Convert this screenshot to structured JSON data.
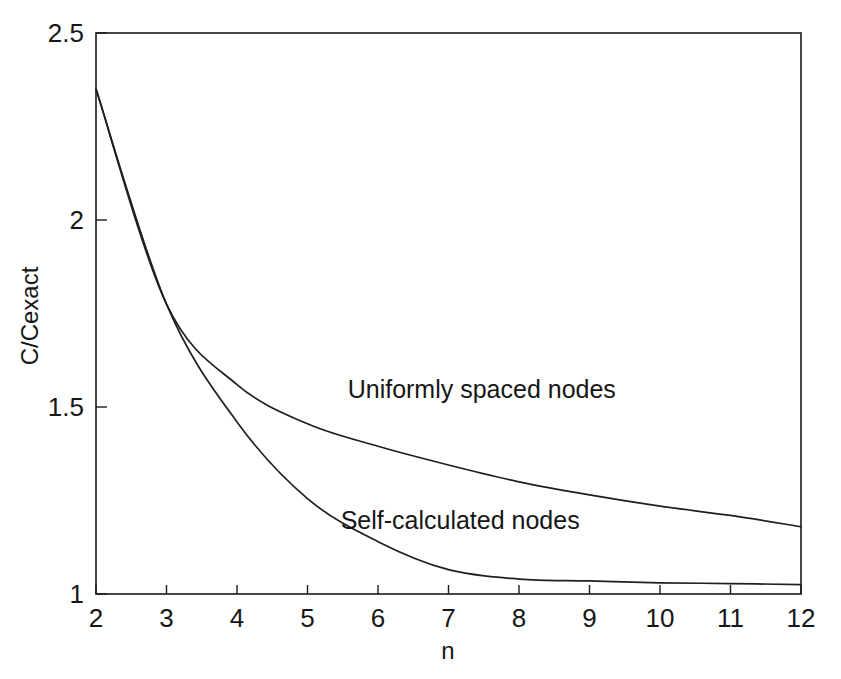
{
  "chart_data": {
    "type": "line",
    "title": "",
    "xlabel": "n",
    "ylabel": "C/Cexact",
    "xlim": [
      2,
      12
    ],
    "ylim": [
      1,
      2.5
    ],
    "grid": false,
    "legend_position": "inline-annotations",
    "x": [
      2,
      3,
      4,
      5,
      6,
      7,
      8,
      9,
      10,
      11,
      12
    ],
    "xticks": [
      2,
      3,
      4,
      5,
      6,
      7,
      8,
      9,
      10,
      11,
      12
    ],
    "xtick_labels": [
      "2",
      "3",
      "4",
      "5",
      "6",
      "7",
      "8",
      "9",
      "10",
      "11",
      "12"
    ],
    "yticks": [
      1,
      1.5,
      2,
      2.5
    ],
    "ytick_labels": [
      "1",
      "1.5",
      "2",
      "2.5"
    ],
    "series": [
      {
        "name": "Uniformly spaced nodes",
        "color": "#1f1f1f",
        "values": [
          2.35,
          1.775,
          1.56,
          1.455,
          1.395,
          1.345,
          1.3,
          1.265,
          1.235,
          1.21,
          1.18
        ],
        "annotation": {
          "text": "Uniformly spaced nodes",
          "x": 5.57,
          "y": 1.525
        }
      },
      {
        "name": "Self-calculated nodes",
        "color": "#1f1f1f",
        "values": [
          2.35,
          1.775,
          1.46,
          1.255,
          1.14,
          1.065,
          1.04,
          1.035,
          1.03,
          1.028,
          1.025
        ],
        "annotation": {
          "text": "Self-calculated nodes",
          "x": 5.47,
          "y": 1.175
        }
      }
    ]
  },
  "figure": {
    "background_color": "#ffffff",
    "axis_color": "#1a1a1a",
    "text_color": "#161616"
  }
}
